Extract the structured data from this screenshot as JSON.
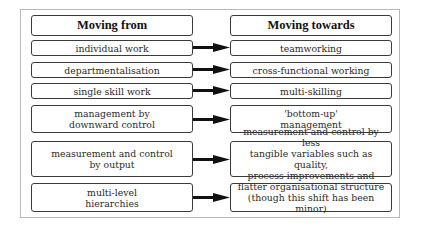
{
  "diagram": {
    "headers": {
      "from": "Moving from",
      "towards": "Moving towards"
    },
    "rows": [
      {
        "from": "individual work",
        "towards": "teamworking"
      },
      {
        "from": "departmentalisation",
        "towards": "cross-functional working"
      },
      {
        "from": "single skill work",
        "towards": "multi-skilling"
      },
      {
        "from": "management by\ndownward control",
        "towards": "'bottom-up'\nmanagement"
      },
      {
        "from": "measurement and control\nby output",
        "towards": "measurement and control by less\ntangible variables such as quality,\nprocess improvements and motivation"
      },
      {
        "from": "multi-level\nhierarchies",
        "towards": "flatter organisational structure\n(though this shift has been minor)"
      }
    ],
    "arrow_icon": "right-arrow-icon",
    "colors": {
      "box_border": "#3a3a3a",
      "frame_border": "#b8b8b8",
      "arrow": "#111111",
      "text": "#2a2a2a"
    }
  }
}
